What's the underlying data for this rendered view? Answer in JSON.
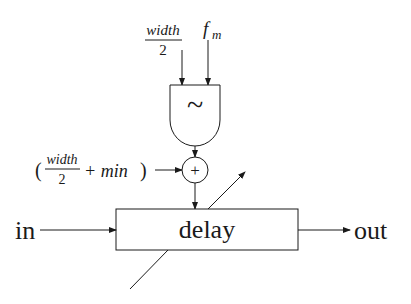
{
  "diagram": {
    "type": "signal-flow block diagram (vibrato / flanger delay modulation)",
    "inputs_top": {
      "width_fraction": {
        "numerator": "width",
        "denominator": "2"
      },
      "fm_label": "f",
      "fm_subscript": "m"
    },
    "oscillator": {
      "symbol": "~",
      "label": "oscillator"
    },
    "offset_input": {
      "open_paren": "(",
      "numerator": "width",
      "denominator": "2",
      "plus_min": "+ min",
      "close_paren": ")"
    },
    "adder": {
      "symbol": "+"
    },
    "delay_block": {
      "label": "delay"
    },
    "input_label": "in",
    "output_label": "out",
    "variable_arrow": "diagonal arrow through delay block indicating modulated delay time"
  }
}
